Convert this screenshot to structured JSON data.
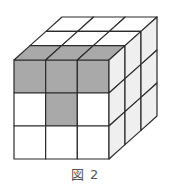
{
  "figure": {
    "caption": "図 2",
    "grid_size": 3,
    "colors": {
      "shaded": "#a9a9a9",
      "front_white": "#ffffff",
      "top_white": "#ffffff",
      "right_face": "#efefef",
      "stroke": "#2b2b2b"
    },
    "front_face_shaded": [
      [
        true,
        true,
        true
      ],
      [
        false,
        true,
        false
      ],
      [
        false,
        false,
        false
      ]
    ],
    "top_face_shaded": [
      [
        false,
        false,
        false
      ],
      [
        false,
        false,
        false
      ],
      [
        true,
        true,
        true
      ]
    ],
    "right_face_shaded": [
      [
        false,
        false,
        false
      ],
      [
        false,
        false,
        false
      ],
      [
        false,
        false,
        false
      ]
    ]
  }
}
